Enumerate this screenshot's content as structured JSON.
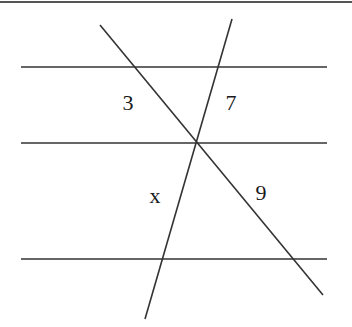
{
  "figure": {
    "type": "geometry-diagram",
    "stroke_color": "#333333",
    "top_border": {
      "x1": 0,
      "y1": 2,
      "x2": 352,
      "y2": 2
    },
    "parallel_lines": [
      {
        "name": "top-parallel-line",
        "x1": 21,
        "y1": 67,
        "x2": 327,
        "y2": 67
      },
      {
        "name": "middle-parallel-line",
        "x1": 21,
        "y1": 143,
        "x2": 327,
        "y2": 143
      },
      {
        "name": "bottom-parallel-line",
        "x1": 21,
        "y1": 259,
        "x2": 327,
        "y2": 259
      }
    ],
    "transversals": [
      {
        "name": "transversal-descending",
        "x1": 100,
        "y1": 25,
        "x2": 323,
        "y2": 295
      },
      {
        "name": "transversal-steep",
        "x1": 232,
        "y1": 19,
        "x2": 145,
        "y2": 319
      }
    ],
    "intersection_point": {
      "x": 197,
      "y": 143
    }
  },
  "labels": {
    "segment_upper_left": {
      "text": "3",
      "x": 128,
      "y": 103
    },
    "segment_upper_right": {
      "text": "7",
      "x": 231,
      "y": 103
    },
    "segment_lower_left": {
      "text": "x",
      "x": 155,
      "y": 196
    },
    "segment_lower_right": {
      "text": "9",
      "x": 261,
      "y": 193
    }
  }
}
